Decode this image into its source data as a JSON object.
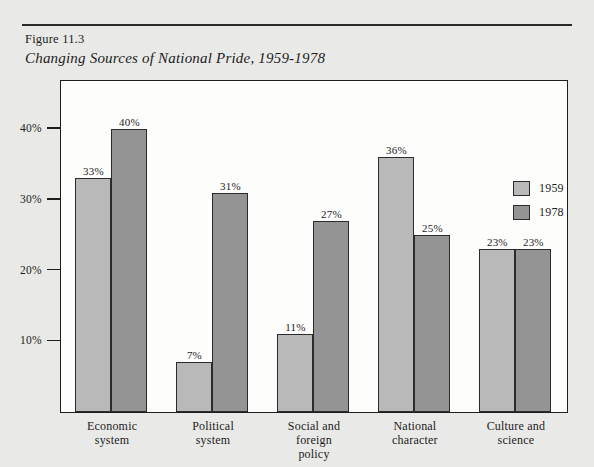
{
  "figure": {
    "number": "Figure 11.3",
    "title": "Changing Sources of National Pride, 1959-1978"
  },
  "legend": {
    "position": "top-right",
    "entries": [
      {
        "label": "1959",
        "color": "#b9b9b9"
      },
      {
        "label": "1978",
        "color": "#949494"
      }
    ]
  },
  "chart_data": {
    "type": "bar",
    "title": "Changing Sources of National Pride, 1959-1978",
    "xlabel": "",
    "ylabel": "",
    "ylim": [
      0,
      45
    ],
    "grid": false,
    "ytick_labels": [
      "40%",
      "30%",
      "20%",
      "10%"
    ],
    "ytick_values": [
      40,
      30,
      20,
      10
    ],
    "categories": [
      "Economic system",
      "Political system",
      "Social and foreign policy",
      "National character",
      "Culture and science"
    ],
    "category_lines": [
      [
        "Economic",
        "system"
      ],
      [
        "Political",
        "system"
      ],
      [
        "Social and",
        "foreign",
        "policy"
      ],
      [
        "National",
        "character"
      ],
      [
        "Culture and",
        "science"
      ]
    ],
    "series": [
      {
        "name": "1959",
        "color": "#b9b9b9",
        "values": [
          33,
          7,
          11,
          36,
          23
        ]
      },
      {
        "name": "1978",
        "color": "#949494",
        "values": [
          40,
          31,
          27,
          25,
          23
        ]
      }
    ],
    "data_labels": [
      [
        "33%",
        "40%"
      ],
      [
        "7%",
        "31%"
      ],
      [
        "11%",
        "27%"
      ],
      [
        "36%",
        "25%"
      ],
      [
        "23%",
        "23%"
      ]
    ]
  }
}
